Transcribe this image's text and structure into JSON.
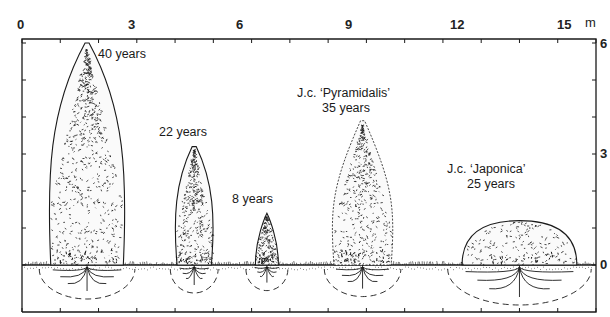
{
  "figure": {
    "title": "",
    "top_axis": {
      "unit": "m",
      "tick_labels": [
        "0",
        "3",
        "6",
        "9",
        "12",
        "15"
      ],
      "range": [
        0,
        15
      ],
      "minor_tick_step": 1
    },
    "right_axis": {
      "tick_labels": [
        "6",
        "3",
        "0"
      ],
      "range": [
        -1,
        6
      ],
      "minor_tick_step": 1
    },
    "trees": [
      {
        "id": "tree-40",
        "label_lines": [
          "40 years"
        ],
        "x_center_m": 1.7,
        "height_m": 6.0,
        "width_m": 2.0,
        "shape": "columnar-tall"
      },
      {
        "id": "tree-22",
        "label_lines": [
          "22 years"
        ],
        "x_center_m": 4.5,
        "height_m": 3.2,
        "width_m": 1.0,
        "shape": "columnar"
      },
      {
        "id": "tree-8",
        "label_lines": [
          "8 years"
        ],
        "x_center_m": 6.4,
        "height_m": 1.4,
        "width_m": 0.6,
        "shape": "small-conical"
      },
      {
        "id": "tree-pyramidalis",
        "label_lines": [
          "J.c. ‘Pyramidalis’",
          "35 years"
        ],
        "x_center_m": 8.9,
        "height_m": 3.9,
        "width_m": 1.6,
        "shape": "pyramidal"
      },
      {
        "id": "tree-japonica",
        "label_lines": [
          "J.c. ‘Japonica’",
          "25 years"
        ],
        "x_center_m": 13.0,
        "height_m": 1.2,
        "width_m": 3.0,
        "shape": "mounded"
      }
    ],
    "colors": {
      "ink": "#1a1a1a",
      "background": "#ffffff"
    }
  }
}
